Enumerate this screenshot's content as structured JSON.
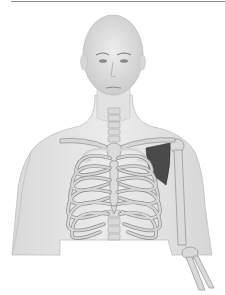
{
  "figure": {
    "colors": {
      "skin": "#e3e3e3",
      "skin_outline": "#bdbdbd",
      "bone": "#d4d4d4",
      "bone_outline": "#8f8f8f",
      "muscle_highlight": "#4a4a4a",
      "rule": "#8c8c8c",
      "background": "#ffffff"
    }
  }
}
